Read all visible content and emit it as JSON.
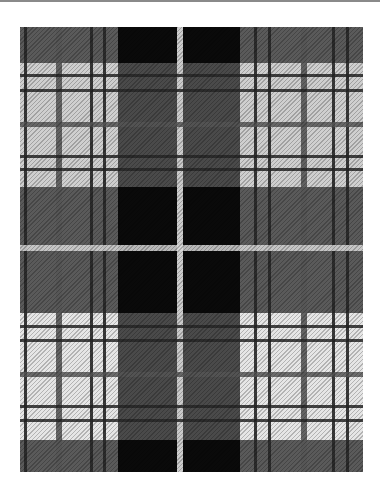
{
  "image": {
    "description": "Black, white and gray tartan plaid fabric with twill weave",
    "width": 380,
    "height": 501,
    "fabric_bounds": {
      "x": 20,
      "y": 27,
      "w": 343,
      "h": 445
    }
  },
  "colors": {
    "background": "#ffffff",
    "top_rule": "#8a8a8a",
    "dark_gray": "#5a5a5a",
    "light": "#cfcfcf",
    "lighter": "#e6e6e6",
    "black": "#0a0a0a",
    "line_dark": "#262626",
    "line_gray": "#555555",
    "white_stripe": "#d8d8d8"
  },
  "light_bands_y": [
    {
      "y": 36,
      "h": 124,
      "shade": "light"
    },
    {
      "y": 286,
      "h": 127,
      "shade": "lighter"
    }
  ],
  "light_columns_x": [
    {
      "x": 0,
      "w": 98
    },
    {
      "x": 220,
      "w": 123
    }
  ],
  "black_blocks": [
    {
      "x": 98,
      "y": 0,
      "w": 59,
      "h": 36
    },
    {
      "x": 163,
      "y": 0,
      "w": 57,
      "h": 36
    },
    {
      "x": 98,
      "y": 160,
      "w": 59,
      "h": 126
    },
    {
      "x": 163,
      "y": 160,
      "w": 57,
      "h": 126
    },
    {
      "x": 98,
      "y": 413,
      "w": 59,
      "h": 32
    },
    {
      "x": 163,
      "y": 413,
      "w": 57,
      "h": 32
    }
  ],
  "vertical_lines": [
    {
      "x": 4,
      "w": 3,
      "color": "line_dark"
    },
    {
      "x": 36,
      "w": 6,
      "color": "line_gray"
    },
    {
      "x": 70,
      "w": 3,
      "color": "line_dark"
    },
    {
      "x": 83,
      "w": 3,
      "color": "line_dark"
    },
    {
      "x": 157,
      "w": 6,
      "color": "white_stripe"
    },
    {
      "x": 234,
      "w": 3,
      "color": "line_dark"
    },
    {
      "x": 248,
      "w": 3,
      "color": "line_dark"
    },
    {
      "x": 281,
      "w": 6,
      "color": "line_gray"
    },
    {
      "x": 312,
      "w": 3,
      "color": "line_dark"
    },
    {
      "x": 326,
      "w": 3,
      "color": "line_dark"
    }
  ],
  "horizontal_lines": [
    {
      "y": 47,
      "h": 3,
      "color": "line_dark"
    },
    {
      "y": 62,
      "h": 3,
      "color": "line_dark"
    },
    {
      "y": 95,
      "h": 5,
      "color": "line_gray"
    },
    {
      "y": 128,
      "h": 3,
      "color": "line_dark"
    },
    {
      "y": 141,
      "h": 3,
      "color": "line_dark"
    },
    {
      "y": 218,
      "h": 6,
      "color": "white_stripe"
    },
    {
      "y": 298,
      "h": 3,
      "color": "line_dark"
    },
    {
      "y": 312,
      "h": 3,
      "color": "line_dark"
    },
    {
      "y": 345,
      "h": 5,
      "color": "line_gray"
    },
    {
      "y": 378,
      "h": 3,
      "color": "line_dark"
    },
    {
      "y": 392,
      "h": 3,
      "color": "line_dark"
    }
  ]
}
